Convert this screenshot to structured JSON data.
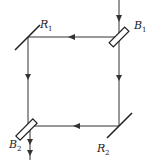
{
  "diagram": {
    "type": "interferometer (Sagnac-type loop)",
    "components": [
      {
        "id": "B1",
        "kind": "beam-splitter",
        "label": "B",
        "sub": "1"
      },
      {
        "id": "R1",
        "kind": "mirror",
        "label": "R",
        "sub": "1"
      },
      {
        "id": "B2",
        "kind": "beam-splitter",
        "label": "B",
        "sub": "2"
      },
      {
        "id": "R2",
        "kind": "mirror",
        "label": "R",
        "sub": "2"
      }
    ],
    "paths": [
      {
        "from": "input",
        "to": "B1",
        "direction": "down"
      },
      {
        "from": "B1",
        "to": "R1",
        "direction": "left"
      },
      {
        "from": "R1",
        "to": "B2",
        "direction": "down"
      },
      {
        "from": "B1",
        "to": "R2",
        "direction": "down"
      },
      {
        "from": "R2",
        "to": "B2",
        "direction": "left"
      },
      {
        "from": "B2",
        "to": "output",
        "direction": "down"
      }
    ],
    "colors": {
      "line": "#333333",
      "background": "#ffffff"
    }
  }
}
